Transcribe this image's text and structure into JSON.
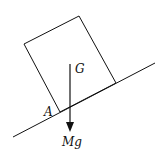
{
  "diagram": {
    "labels": {
      "centre_of_mass": "G",
      "pivot_corner": "A",
      "weight": "Mg"
    },
    "colors": {
      "stroke": "#111111",
      "background": "#ffffff"
    }
  }
}
